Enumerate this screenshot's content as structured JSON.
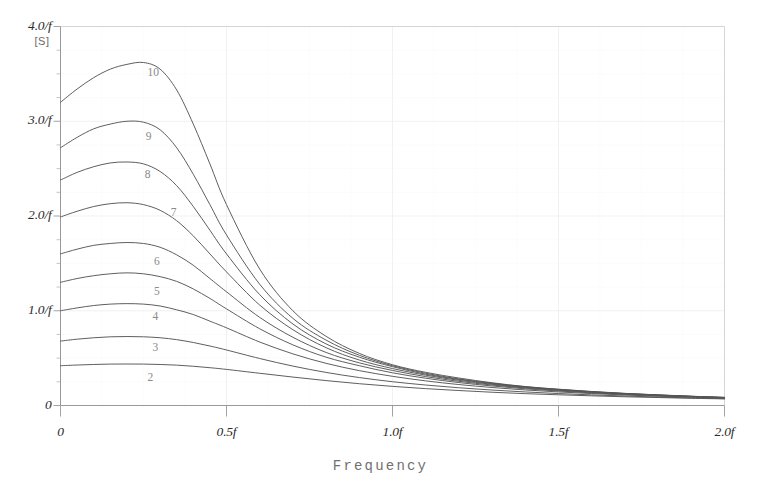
{
  "chart_data": {
    "type": "line",
    "title": "",
    "xlabel": "Frequency",
    "ylabel": "",
    "yunit": "[S]",
    "xlim": [
      0,
      2
    ],
    "ylim": [
      0,
      4
    ],
    "grid": true,
    "legend_position": "inline-curve-labels",
    "x_ticks": [
      {
        "value": 0,
        "label": "0"
      },
      {
        "value": 0.5,
        "label": "0.5f"
      },
      {
        "value": 1.0,
        "label": "1.0f"
      },
      {
        "value": 1.5,
        "label": "1.5f"
      },
      {
        "value": 2.0,
        "label": "2.0f"
      }
    ],
    "y_ticks": [
      {
        "value": 0,
        "label": "0"
      },
      {
        "value": 1,
        "label": "1.0/f"
      },
      {
        "value": 2,
        "label": "2.0/f"
      },
      {
        "value": 3,
        "label": "3.0/f"
      },
      {
        "value": 4,
        "label": "4.0/f"
      }
    ],
    "x_minor_count": 4,
    "y_minor_count": 4,
    "x": [
      0,
      0.05,
      0.1,
      0.15,
      0.2,
      0.25,
      0.3,
      0.35,
      0.4,
      0.45,
      0.5,
      0.6,
      0.7,
      0.8,
      0.9,
      1.0,
      1.1,
      1.2,
      1.3,
      1.4,
      1.5,
      1.6,
      1.7,
      1.8,
      1.9,
      2.0
    ],
    "series": [
      {
        "name": "10",
        "label": "10",
        "label_x": 0.28,
        "label_y": 3.5,
        "values": [
          3.2,
          3.34,
          3.46,
          3.55,
          3.6,
          3.62,
          3.55,
          3.33,
          2.97,
          2.55,
          2.12,
          1.44,
          1.0,
          0.73,
          0.55,
          0.43,
          0.35,
          0.29,
          0.24,
          0.2,
          0.172,
          0.148,
          0.128,
          0.112,
          0.098,
          0.086
        ]
      },
      {
        "name": "9",
        "label": "9",
        "label_x": 0.275,
        "label_y": 2.82,
        "values": [
          2.72,
          2.83,
          2.92,
          2.97,
          3.0,
          2.99,
          2.91,
          2.72,
          2.44,
          2.12,
          1.8,
          1.28,
          0.92,
          0.69,
          0.53,
          0.42,
          0.34,
          0.28,
          0.235,
          0.198,
          0.17,
          0.146,
          0.127,
          0.111,
          0.097,
          0.085
        ]
      },
      {
        "name": "8",
        "label": "8",
        "label_x": 0.272,
        "label_y": 2.42,
        "values": [
          2.38,
          2.46,
          2.52,
          2.56,
          2.57,
          2.55,
          2.47,
          2.32,
          2.1,
          1.85,
          1.6,
          1.17,
          0.86,
          0.65,
          0.51,
          0.41,
          0.33,
          0.275,
          0.23,
          0.194,
          0.167,
          0.144,
          0.125,
          0.11,
          0.096,
          0.084
        ]
      },
      {
        "name": "7",
        "label": "7",
        "label_x": 0.35,
        "label_y": 2.02,
        "values": [
          1.99,
          2.05,
          2.1,
          2.13,
          2.14,
          2.12,
          2.06,
          1.95,
          1.79,
          1.6,
          1.41,
          1.06,
          0.8,
          0.61,
          0.48,
          0.39,
          0.32,
          0.266,
          0.224,
          0.19,
          0.164,
          0.142,
          0.123,
          0.108,
          0.095,
          0.083
        ]
      },
      {
        "name": "6",
        "label": "6",
        "label_x": 0.3,
        "label_y": 1.5,
        "values": [
          1.6,
          1.65,
          1.69,
          1.71,
          1.72,
          1.71,
          1.67,
          1.59,
          1.48,
          1.34,
          1.2,
          0.93,
          0.72,
          0.56,
          0.45,
          0.37,
          0.305,
          0.255,
          0.216,
          0.184,
          0.159,
          0.138,
          0.12,
          0.106,
          0.093,
          0.082
        ]
      },
      {
        "name": "5",
        "label": "5",
        "label_x": 0.3,
        "label_y": 1.19,
        "values": [
          1.3,
          1.34,
          1.37,
          1.39,
          1.4,
          1.39,
          1.36,
          1.31,
          1.23,
          1.13,
          1.02,
          0.81,
          0.64,
          0.51,
          0.42,
          0.345,
          0.288,
          0.242,
          0.206,
          0.176,
          0.153,
          0.133,
          0.117,
          0.103,
          0.091,
          0.08
        ]
      },
      {
        "name": "4",
        "label": "4",
        "label_x": 0.295,
        "label_y": 0.92,
        "values": [
          1.0,
          1.03,
          1.055,
          1.07,
          1.075,
          1.07,
          1.05,
          1.01,
          0.96,
          0.89,
          0.82,
          0.67,
          0.545,
          0.445,
          0.368,
          0.308,
          0.26,
          0.221,
          0.19,
          0.164,
          0.143,
          0.126,
          0.111,
          0.098,
          0.087,
          0.078
        ]
      },
      {
        "name": "3",
        "label": "3",
        "label_x": 0.295,
        "label_y": 0.6,
        "values": [
          0.68,
          0.7,
          0.715,
          0.725,
          0.728,
          0.725,
          0.715,
          0.695,
          0.665,
          0.628,
          0.586,
          0.496,
          0.416,
          0.349,
          0.295,
          0.251,
          0.216,
          0.187,
          0.163,
          0.143,
          0.126,
          0.112,
          0.1,
          0.089,
          0.08,
          0.072
        ]
      },
      {
        "name": "2",
        "label": "2",
        "label_x": 0.28,
        "label_y": 0.28,
        "values": [
          0.42,
          0.427,
          0.433,
          0.437,
          0.438,
          0.437,
          0.433,
          0.426,
          0.414,
          0.399,
          0.381,
          0.34,
          0.3,
          0.263,
          0.23,
          0.202,
          0.178,
          0.158,
          0.14,
          0.125,
          0.113,
          0.102,
          0.092,
          0.084,
          0.076,
          0.07
        ]
      }
    ],
    "colors": {
      "curve": "#555555",
      "axis": "#999999",
      "grid": "#eeeeee",
      "text": "#2b2b2b",
      "label_text": "#8a8a8a",
      "axis_title": "#707070"
    }
  }
}
